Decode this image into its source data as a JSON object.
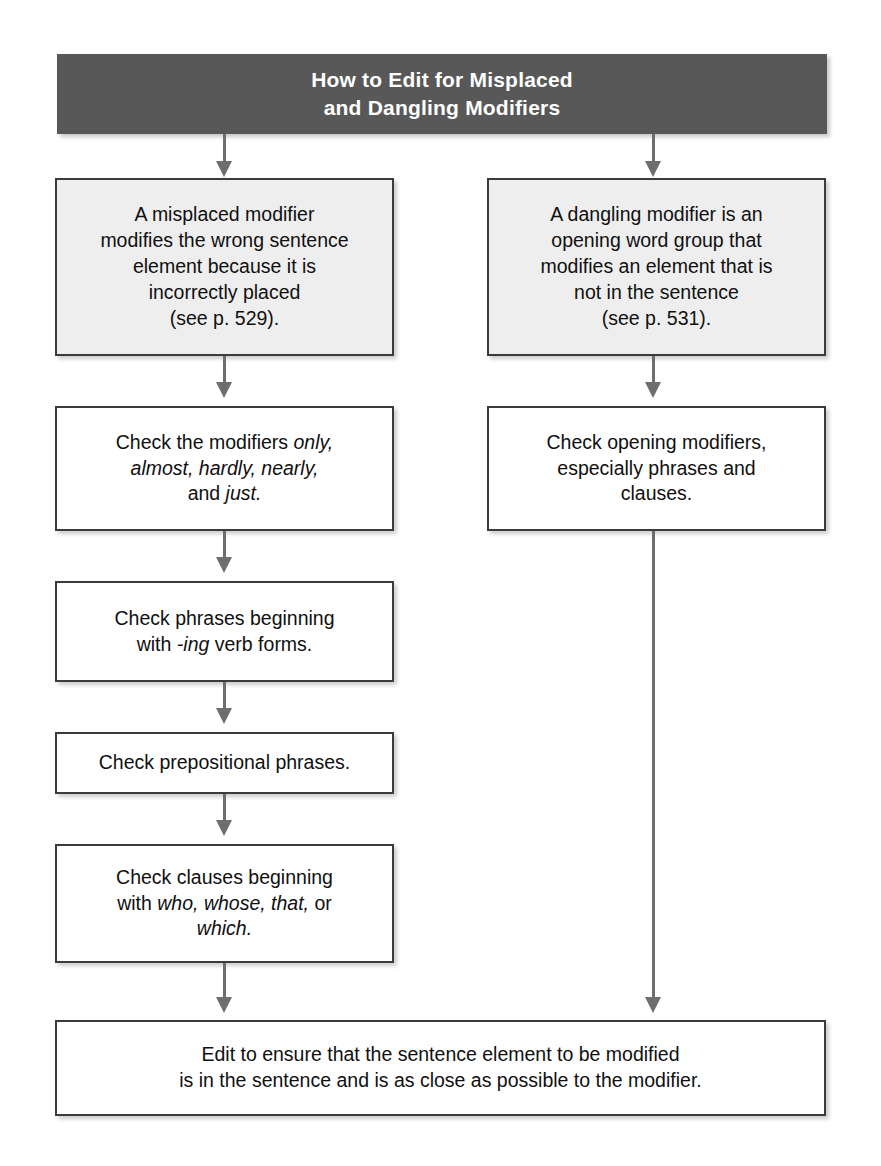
{
  "header": {
    "line1": "How to Edit for Misplaced",
    "line2": "and Dangling Modifiers"
  },
  "left_column": {
    "box1": {
      "line1": "A misplaced modifier",
      "line2": "modifies the wrong sentence",
      "line3": "element because it is",
      "line4": "incorrectly placed",
      "line5": "(see p. 529)."
    },
    "box2": {
      "part1": "Check the modifiers ",
      "em1": "only,",
      "em2": "almost, hardly, nearly,",
      "part2": "and ",
      "em3": "just."
    },
    "box3": {
      "line1": "Check phrases beginning",
      "part1": "with ",
      "em1": "-ing",
      "part2": " verb forms."
    },
    "box4": {
      "line1": "Check prepositional phrases."
    },
    "box5": {
      "line1": "Check clauses beginning",
      "part1": "with ",
      "em1": "who, whose, that,",
      "part2": " or",
      "em2": "which."
    }
  },
  "right_column": {
    "box1": {
      "line1": "A dangling modifier is an",
      "line2": "opening word group that",
      "line3": "modifies an element that is",
      "line4": "not in the sentence",
      "line5": "(see p. 531)."
    },
    "box2": {
      "line1": "Check opening modifiers,",
      "line2": "especially phrases and",
      "line3": "clauses."
    }
  },
  "footer_box": {
    "line1": "Edit to ensure that the sentence element to be modified",
    "line2": "is in the sentence and is as close as possible to the modifier."
  },
  "colors": {
    "banner_background": "#585858",
    "banner_text": "#ffffff",
    "box_border": "#3b3b3b",
    "box_fill": "#ffffff",
    "box_fill_tinted": "#eeeeee",
    "connector": "#6e6e6e"
  }
}
